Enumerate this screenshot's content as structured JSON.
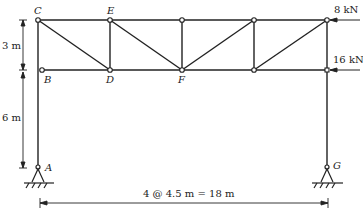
{
  "diagram": {
    "type": "truss-frame",
    "nodes": {
      "A": "A",
      "B": "B",
      "C": "C",
      "D": "D",
      "E": "E",
      "F": "F",
      "G": "G"
    },
    "loads": {
      "top": "8 kN",
      "bottom": "16 kN"
    },
    "dimensions": {
      "upper_height": "3 m",
      "lower_height": "6 m",
      "span": "4 @ 4.5 m = 18 m"
    },
    "colors": {
      "line": "#222222",
      "background": "#ffffff"
    }
  }
}
